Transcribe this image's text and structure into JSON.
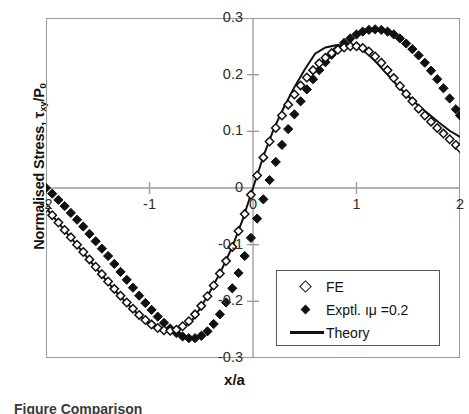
{
  "chart_data": {
    "type": "scatter",
    "title": "",
    "xlabel": "x/a",
    "ylabel": "Normalised Stress, τxy/P0",
    "ylabel_parts": {
      "prefix": "Normalised Stress, ",
      "tau": "τ",
      "tau_sub": "xy",
      "denom": "/P",
      "denom_sub": "0"
    },
    "xlim": [
      -2,
      2
    ],
    "ylim": [
      -0.3,
      0.3
    ],
    "grid": false,
    "legend_position": "lower-right-inside",
    "xticks": [
      -2,
      -1,
      0,
      1,
      2
    ],
    "xtick_labels": [
      "-2",
      "-1",
      "0",
      "1",
      "2"
    ],
    "yticks": [
      0.3,
      0.2,
      0.1,
      0,
      -0.1,
      -0.2,
      -0.3
    ],
    "ytick_labels": [
      "0.3",
      "0.2",
      "0.1",
      "0",
      "-0.1",
      "-0.2",
      "-0.3"
    ],
    "series": [
      {
        "name": "FE",
        "marker": "diamond-open",
        "color": "#111111",
        "x": [
          -2.0,
          -1.94,
          -1.88,
          -1.82,
          -1.76,
          -1.7,
          -1.64,
          -1.58,
          -1.52,
          -1.46,
          -1.4,
          -1.34,
          -1.28,
          -1.22,
          -1.16,
          -1.1,
          -1.04,
          -0.98,
          -0.92,
          -0.86,
          -0.8,
          -0.74,
          -0.68,
          -0.62,
          -0.56,
          -0.5,
          -0.44,
          -0.38,
          -0.32,
          -0.26,
          -0.2,
          -0.14,
          -0.08,
          -0.02,
          0.04,
          0.1,
          0.16,
          0.22,
          0.28,
          0.34,
          0.4,
          0.46,
          0.52,
          0.58,
          0.64,
          0.7,
          0.76,
          0.82,
          0.88,
          0.94,
          1.0,
          1.06,
          1.12,
          1.18,
          1.24,
          1.3,
          1.36,
          1.42,
          1.48,
          1.54,
          1.6,
          1.66,
          1.72,
          1.78,
          1.84,
          1.9,
          1.96,
          2.0
        ],
        "y": [
          -0.035,
          -0.048,
          -0.061,
          -0.074,
          -0.087,
          -0.1,
          -0.113,
          -0.126,
          -0.139,
          -0.152,
          -0.165,
          -0.178,
          -0.19,
          -0.202,
          -0.213,
          -0.224,
          -0.233,
          -0.241,
          -0.247,
          -0.251,
          -0.252,
          -0.25,
          -0.244,
          -0.235,
          -0.223,
          -0.208,
          -0.191,
          -0.172,
          -0.151,
          -0.129,
          -0.104,
          -0.076,
          -0.046,
          -0.012,
          0.022,
          0.054,
          0.082,
          0.106,
          0.128,
          0.147,
          0.165,
          0.181,
          0.195,
          0.208,
          0.22,
          0.23,
          0.238,
          0.244,
          0.248,
          0.25,
          0.25,
          0.247,
          0.241,
          0.232,
          0.221,
          0.208,
          0.194,
          0.18,
          0.166,
          0.153,
          0.14,
          0.128,
          0.117,
          0.106,
          0.096,
          0.086,
          0.076,
          0.07
        ]
      },
      {
        "name": "Exptl. μ =0.2",
        "marker": "diamond-filled",
        "color": "#111111",
        "x": [
          -2.0,
          -1.94,
          -1.88,
          -1.82,
          -1.76,
          -1.7,
          -1.64,
          -1.58,
          -1.52,
          -1.46,
          -1.4,
          -1.34,
          -1.28,
          -1.22,
          -1.16,
          -1.1,
          -1.04,
          -0.98,
          -0.92,
          -0.86,
          -0.8,
          -0.74,
          -0.68,
          -0.62,
          -0.56,
          -0.5,
          -0.44,
          -0.38,
          -0.32,
          -0.26,
          -0.2,
          -0.14,
          -0.08,
          -0.02,
          0.04,
          0.1,
          0.16,
          0.22,
          0.28,
          0.34,
          0.4,
          0.46,
          0.52,
          0.58,
          0.64,
          0.7,
          0.76,
          0.82,
          0.88,
          0.94,
          1.0,
          1.06,
          1.12,
          1.18,
          1.24,
          1.3,
          1.36,
          1.42,
          1.48,
          1.54,
          1.6,
          1.66,
          1.72,
          1.78,
          1.84,
          1.9,
          1.96,
          2.0
        ],
        "y": [
          0.0,
          -0.01,
          -0.021,
          -0.032,
          -0.044,
          -0.056,
          -0.068,
          -0.081,
          -0.094,
          -0.107,
          -0.12,
          -0.134,
          -0.148,
          -0.162,
          -0.176,
          -0.19,
          -0.203,
          -0.215,
          -0.227,
          -0.238,
          -0.248,
          -0.256,
          -0.262,
          -0.265,
          -0.265,
          -0.261,
          -0.253,
          -0.24,
          -0.223,
          -0.202,
          -0.177,
          -0.15,
          -0.12,
          -0.088,
          -0.054,
          -0.02,
          0.014,
          0.046,
          0.076,
          0.104,
          0.13,
          0.153,
          0.174,
          0.192,
          0.208,
          0.222,
          0.235,
          0.246,
          0.256,
          0.264,
          0.271,
          0.276,
          0.279,
          0.28,
          0.279,
          0.276,
          0.271,
          0.264,
          0.255,
          0.245,
          0.234,
          0.221,
          0.207,
          0.192,
          0.176,
          0.158,
          0.139,
          0.128
        ]
      },
      {
        "name": "Theory",
        "marker": "line",
        "color": "#111111",
        "x": [
          -2.0,
          -1.9,
          -1.8,
          -1.7,
          -1.6,
          -1.5,
          -1.4,
          -1.3,
          -1.2,
          -1.1,
          -1.0,
          -0.9,
          -0.8,
          -0.7,
          -0.6,
          -0.5,
          -0.4,
          -0.3,
          -0.2,
          -0.1,
          0.0,
          0.1,
          0.2,
          0.3,
          0.4,
          0.5,
          0.6,
          0.7,
          0.8,
          0.9,
          1.0,
          1.1,
          1.2,
          1.3,
          1.4,
          1.5,
          1.6,
          1.7,
          1.8,
          1.9,
          2.0
        ],
        "y": [
          -0.035,
          -0.057,
          -0.079,
          -0.101,
          -0.123,
          -0.145,
          -0.167,
          -0.188,
          -0.207,
          -0.225,
          -0.239,
          -0.249,
          -0.252,
          -0.248,
          -0.237,
          -0.209,
          -0.178,
          -0.143,
          -0.104,
          -0.056,
          0.0,
          0.056,
          0.104,
          0.143,
          0.178,
          0.209,
          0.237,
          0.248,
          0.252,
          0.252,
          0.249,
          0.238,
          0.22,
          0.2,
          0.18,
          0.162,
          0.145,
          0.13,
          0.115,
          0.101,
          0.09
        ]
      }
    ]
  },
  "axes": {
    "y_title_prefix": "Normalised Stress, ",
    "y_title_tau": "τ",
    "y_title_tau_sub": "xy",
    "y_title_denom": "/P",
    "y_title_denom_sub": "0",
    "x_title": "x/a"
  },
  "legend": {
    "entries": [
      {
        "label": "FE",
        "marker": "diamond-open"
      },
      {
        "label": "Exptl. ıμ  =0.2",
        "marker": "diamond-filled"
      },
      {
        "label": "Theory",
        "marker": "line"
      }
    ]
  },
  "caption": {
    "text": "Figure    Comparison"
  }
}
